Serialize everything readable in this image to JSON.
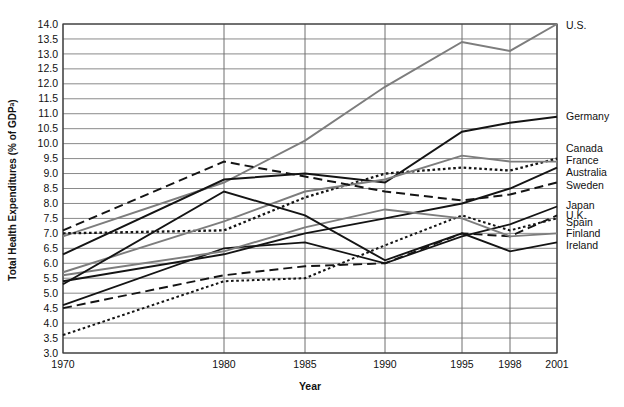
{
  "chart_data": {
    "type": "line",
    "title": "",
    "xlabel": "Year",
    "ylabel": "Total Health Expenditures (% of GDPᵃ)",
    "x": [
      1970,
      1980,
      1985,
      1990,
      1995,
      1998,
      2001
    ],
    "xtick_labels": [
      "1970",
      "1980",
      "1985",
      "1990",
      "1995",
      "1998",
      "2001"
    ],
    "ylim": [
      3.0,
      14.0
    ],
    "ytick_labels": [
      "3.0",
      "3.5",
      "4.0",
      "4.5",
      "5.0",
      "5.5",
      "6.0",
      "6.5",
      "7.0",
      "7.5",
      "8.0",
      "8.5",
      "9.0",
      "9.5",
      "10.0",
      "10.5",
      "11.0",
      "11.5",
      "12.0",
      "12.5",
      "13.0",
      "13.5",
      "14.0"
    ],
    "yticks": [
      3.0,
      3.5,
      4.0,
      4.5,
      5.0,
      5.5,
      6.0,
      6.5,
      7.0,
      7.5,
      8.0,
      8.5,
      9.0,
      9.5,
      10.0,
      10.5,
      11.0,
      11.5,
      12.0,
      12.5,
      13.0,
      13.5,
      14.0
    ],
    "grid": "horizontal-and-vertical",
    "legend_position": "right-of-plot-inline",
    "series": [
      {
        "name": "U.S.",
        "values": [
          6.9,
          8.7,
          10.1,
          11.9,
          13.4,
          13.1,
          14.0
        ],
        "style": "solid",
        "color": "#7d7d7d",
        "width": 1.9,
        "label_y": 13.95
      },
      {
        "name": "Germany",
        "values": [
          6.3,
          8.8,
          9.0,
          8.7,
          10.4,
          10.7,
          10.9
        ],
        "style": "solid",
        "color": "#141414",
        "width": 2.0,
        "label_y": 10.9
      },
      {
        "name": "Canada",
        "values": [
          7.0,
          7.1,
          8.2,
          9.0,
          9.2,
          9.1,
          9.5
        ],
        "style": "dotted",
        "color": "#141414",
        "width": 2.3,
        "label_y": 9.85
      },
      {
        "name": "France",
        "values": [
          5.7,
          7.4,
          8.4,
          8.8,
          9.6,
          9.4,
          9.4
        ],
        "style": "solid",
        "color": "#7d7d7d",
        "width": 1.9,
        "label_y": 9.45
      },
      {
        "name": "Australia",
        "values": [
          5.4,
          6.3,
          7.0,
          7.5,
          8.0,
          8.5,
          9.2
        ],
        "style": "solid",
        "color": "#141414",
        "width": 1.9,
        "label_y": 9.05
      },
      {
        "name": "Sweden",
        "values": [
          7.1,
          9.4,
          8.9,
          8.4,
          8.1,
          8.3,
          8.7
        ],
        "style": "dashed",
        "color": "#141414",
        "width": 2.0,
        "label_y": 8.6
      },
      {
        "name": "Japan",
        "values": [
          4.6,
          6.5,
          6.7,
          6.0,
          6.9,
          7.3,
          7.9
        ],
        "style": "solid",
        "color": "#141414",
        "width": 1.7,
        "label_y": 7.95
      },
      {
        "name": "U.K.",
        "values": [
          4.5,
          5.6,
          5.9,
          6.0,
          7.0,
          6.9,
          7.6
        ],
        "style": "dashed",
        "color": "#141414",
        "width": 1.9,
        "label_y": 7.6
      },
      {
        "name": "Spain",
        "values": [
          3.6,
          5.4,
          5.5,
          6.6,
          7.6,
          7.1,
          7.5
        ],
        "style": "dotted",
        "color": "#141414",
        "width": 2.0,
        "label_y": 7.35
      },
      {
        "name": "Finland",
        "values": [
          5.6,
          6.4,
          7.2,
          7.8,
          7.5,
          6.9,
          7.0
        ],
        "style": "solid",
        "color": "#7d7d7d",
        "width": 1.9,
        "label_y": 7.0
      },
      {
        "name": "Ireland",
        "values": [
          5.3,
          8.4,
          7.6,
          6.1,
          7.0,
          6.4,
          6.7
        ],
        "style": "solid",
        "color": "#141414",
        "width": 1.9,
        "label_y": 6.6
      }
    ]
  },
  "layout": {
    "plot_left": 63,
    "plot_right": 557,
    "plot_top": 24,
    "plot_bottom": 353,
    "label_x": 566,
    "axis_title_x": 310,
    "axis_title_y": 390,
    "ylabel_x": 16,
    "ylabel_y": 190
  }
}
